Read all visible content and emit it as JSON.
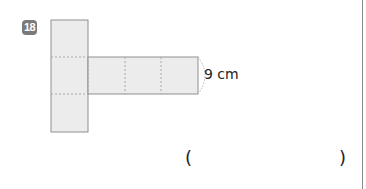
{
  "problem": {
    "number": "18",
    "dimension_label": "9 cm",
    "answer_open": "(",
    "answer_close": ")",
    "answer_value": ""
  },
  "figure": {
    "type": "cube-net",
    "square_count": 6,
    "fill_color": "#ececec",
    "edge_color": "#8f8f8f"
  }
}
